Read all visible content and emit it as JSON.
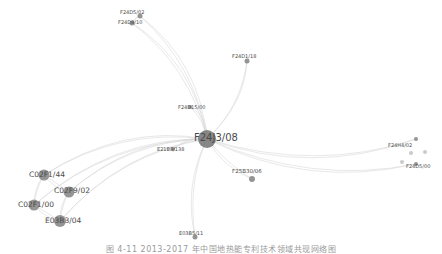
{
  "diagram": {
    "type": "network-graph",
    "hub": "F24J3/08",
    "nodes": [
      {
        "id": "F24J3/08",
        "label": "F24J3/08",
        "x": 207,
        "y": 139,
        "r": 9,
        "font": 10,
        "lx": 194,
        "ly": 138
      },
      {
        "id": "F24D5/02",
        "label": "F24D5/02",
        "x": 140,
        "y": 16,
        "r": 2.5,
        "font": 5,
        "lx": 120,
        "ly": 12
      },
      {
        "id": "F24D9/10",
        "label": "F24D9/10",
        "x": 132,
        "y": 23,
        "r": 2.5,
        "font": 5,
        "lx": 118,
        "ly": 22
      },
      {
        "id": "F24D1/18",
        "label": "F24D1/18",
        "x": 247,
        "y": 61,
        "r": 2.5,
        "font": 5,
        "lx": 232,
        "ly": 56
      },
      {
        "id": "F24D15/00",
        "label": "F24D15/00",
        "x": 190,
        "y": 107,
        "r": 2,
        "font": 5,
        "lx": 178,
        "ly": 107
      },
      {
        "id": "E21B8/138",
        "label": "E21B8/138",
        "x": 173,
        "y": 149,
        "r": 2,
        "font": 5,
        "lx": 157,
        "ly": 149
      },
      {
        "id": "F25B30/06",
        "label": "F25B30/06",
        "x": 252,
        "y": 179,
        "r": 3,
        "font": 5.5,
        "lx": 232,
        "ly": 172
      },
      {
        "id": "F24H4/02",
        "label": "F24H4/02",
        "x": 416,
        "y": 139,
        "r": 2,
        "font": 5,
        "lx": 388,
        "ly": 145
      },
      {
        "id": "F24D5/00",
        "label": "F24D5/00",
        "x": 416,
        "y": 164,
        "r": 2,
        "font": 5,
        "lx": 406,
        "ly": 166
      },
      {
        "id": "X1",
        "label": "",
        "x": 411,
        "y": 153,
        "r": 2,
        "font": 5,
        "lx": 0,
        "ly": 0
      },
      {
        "id": "X2",
        "label": "",
        "x": 425,
        "y": 152,
        "r": 2,
        "font": 5,
        "lx": 0,
        "ly": 0
      },
      {
        "id": "X3",
        "label": "",
        "x": 402,
        "y": 162,
        "r": 2,
        "font": 5,
        "lx": 0,
        "ly": 0
      },
      {
        "id": "C02F1/44",
        "label": "C02F1/44",
        "x": 44,
        "y": 175,
        "r": 5.5,
        "font": 7.5,
        "lx": 29,
        "ly": 175
      },
      {
        "id": "C02F9/02",
        "label": "C02F9/02",
        "x": 69,
        "y": 192,
        "r": 5.5,
        "font": 7.5,
        "lx": 54,
        "ly": 191
      },
      {
        "id": "C02F1/00",
        "label": "C02F1/00",
        "x": 34,
        "y": 205,
        "r": 5.5,
        "font": 7.5,
        "lx": 18,
        "ly": 205
      },
      {
        "id": "E03B3/04",
        "label": "E03B3/04",
        "x": 60,
        "y": 221,
        "r": 6,
        "font": 7.5,
        "lx": 45,
        "ly": 221
      },
      {
        "id": "E03B5/11",
        "label": "E03B5/11",
        "x": 195,
        "y": 237,
        "r": 2.5,
        "font": 5,
        "lx": 179,
        "ly": 233
      }
    ],
    "edges": [
      [
        "F24J3/08",
        "F24D5/02"
      ],
      [
        "F24J3/08",
        "F24D9/10"
      ],
      [
        "F24J3/08",
        "F24D1/18"
      ],
      [
        "F24J3/08",
        "F24D15/00"
      ],
      [
        "F24J3/08",
        "E21B8/138"
      ],
      [
        "F24J3/08",
        "F25B30/06"
      ],
      [
        "F24J3/08",
        "F24H4/02"
      ],
      [
        "F24J3/08",
        "F24D5/00"
      ],
      [
        "F24J3/08",
        "C02F1/44"
      ],
      [
        "F24J3/08",
        "C02F9/02"
      ],
      [
        "F24J3/08",
        "C02F1/00"
      ],
      [
        "F24J3/08",
        "E03B3/04"
      ],
      [
        "F24J3/08",
        "E03B5/11"
      ],
      [
        "C02F1/44",
        "C02F9/02"
      ],
      [
        "C02F1/44",
        "C02F1/00"
      ],
      [
        "C02F9/02",
        "E03B3/04"
      ],
      [
        "C02F1/00",
        "E03B3/04"
      ],
      [
        "F24D5/02",
        "F24D9/10"
      ]
    ],
    "colors": {
      "node": "#8a8a8a",
      "hub": "#7a7a7a",
      "edge": "#d8d8d8",
      "label": "#4a4a4a"
    }
  },
  "caption": "图 4-11  2013-2017 年中国地热能专利技术领域共现网络图"
}
